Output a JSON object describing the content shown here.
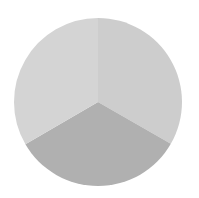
{
  "chart_data": {
    "type": "pie",
    "title": "",
    "categories": [
      "Slice A",
      "Slice B",
      "Slice C"
    ],
    "values": [
      33.3,
      33.3,
      33.4
    ],
    "colors": [
      "#cdcdcd",
      "#b0b0b0",
      "#d4d4d4"
    ],
    "start_angle_deg": 0,
    "direction": "clockwise",
    "labels_visible": false,
    "legend": "none",
    "geometry": {
      "cx": 98,
      "cy": 102,
      "r": 84
    }
  }
}
